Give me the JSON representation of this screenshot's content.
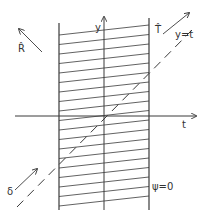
{
  "diagram": {
    "type": "spacetime-strip",
    "colors": {
      "ink": "#3a3a3a",
      "background": "#ffffff"
    },
    "axes": {
      "horizontal": {
        "label": "t",
        "y": 116,
        "x_start": 15,
        "x_end": 196
      },
      "vertical": {
        "label": "y",
        "x": 104,
        "y_start": 210,
        "y_end": 17
      }
    },
    "strip": {
      "left_x": 59,
      "right_x": 149,
      "top_left_y": 23,
      "top_right_y": 18,
      "bottom_y": 210,
      "hatch": {
        "first_right_y": 25,
        "spacing": 9.5,
        "rise": 10,
        "count": 19
      },
      "boundary_label": "ψ=0"
    },
    "diagonal": {
      "label": "y=t",
      "style": "dashed",
      "x1": 17,
      "y1": 207,
      "x2": 192,
      "y2": 30
    },
    "vectors": [
      {
        "name": "R-hat",
        "label": "R̂",
        "x1": 42,
        "y1": 52,
        "x2": 19,
        "y2": 29,
        "label_x": 19,
        "label_y": 52
      },
      {
        "name": "T-hat",
        "label": "T̂",
        "x1": 163,
        "y1": 34,
        "x2": 189,
        "y2": 13,
        "label_x": 156,
        "label_y": 34
      },
      {
        "name": "delta",
        "label": "δ",
        "x1": 15,
        "y1": 190,
        "x2": 37,
        "y2": 169,
        "label_x": 8,
        "label_y": 196
      }
    ],
    "labels": {
      "t_axis": "t",
      "y_axis": "y",
      "diagonal": "y=t",
      "boundary": "ψ=0",
      "R_hat": "R̂",
      "T_hat": "T̂",
      "delta": "δ"
    }
  }
}
